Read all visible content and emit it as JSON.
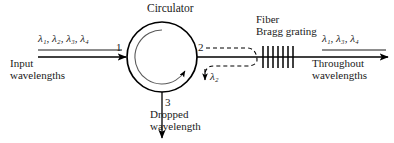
{
  "figure": {
    "type": "optical-add-drop-multiplexer-diagram",
    "background_color": "#ffffff",
    "line_color": "#000000"
  },
  "title": {
    "circulator": "Circulator"
  },
  "input": {
    "wavelengths_symbol": "λ₁, λ₂, λ₃, λ₄",
    "wavelength_list": [
      "λ1",
      "λ2",
      "λ3",
      "λ4"
    ],
    "caption_line1": "Input",
    "caption_line2": "wavelengths"
  },
  "ports": {
    "port1": "1",
    "port2": "2",
    "port3": "3"
  },
  "dropped": {
    "symbol": "λ₂",
    "symbol_base": "λ",
    "symbol_sub": "2",
    "caption_line1": "Dropped",
    "caption_line2": "wavelength"
  },
  "grating": {
    "caption_line1": "Fiber",
    "caption_line2": "Bragg grating",
    "tick_count": 7
  },
  "output": {
    "wavelengths_symbol": "λ₁, λ₃, λ₄",
    "wavelength_list": [
      "λ1",
      "λ3",
      "λ4"
    ],
    "caption_line1": "Throughout",
    "caption_line2": "wavelengths"
  }
}
